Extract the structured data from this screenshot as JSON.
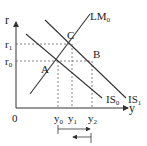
{
  "diagram": {
    "axes": {
      "y_label": "r",
      "x_label": "y",
      "origin": "0"
    },
    "curves": [
      {
        "name": "LM",
        "sub": "0"
      },
      {
        "name": "IS",
        "sub": "0"
      },
      {
        "name": "IS",
        "sub": "1"
      }
    ],
    "points": [
      "A",
      "B",
      "C"
    ],
    "r_ticks": [
      {
        "name": "r",
        "sub": "1"
      },
      {
        "name": "r",
        "sub": "0"
      }
    ],
    "y_ticks": [
      {
        "name": "y",
        "sub": "0"
      },
      {
        "name": "y",
        "sub": "1"
      },
      {
        "name": "y",
        "sub": "2"
      }
    ],
    "colors": {
      "line": "#333333",
      "dash": "#555555"
    }
  }
}
